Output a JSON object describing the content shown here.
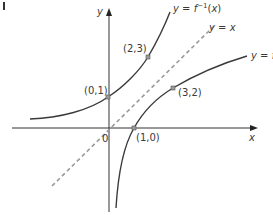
{
  "figure": {
    "corner_mark": "I",
    "axes": {
      "x_label": "x",
      "y_label": "y",
      "origin_label": "0"
    },
    "curves": [
      {
        "id": "f",
        "label": "y = f",
        "type": "logarithmic-like",
        "points_marked": [
          "(1,0)",
          "(3,2)"
        ]
      },
      {
        "id": "f_inverse",
        "label": "y = f⁻¹(x)",
        "label_parts": {
          "prefix": "y = f",
          "sup": "−1",
          "suffix": "(x)"
        },
        "type": "exponential-like",
        "points_marked": [
          "(0,1)",
          "(2,3)"
        ]
      },
      {
        "id": "identity",
        "label": "y = x",
        "style": "dashed"
      }
    ],
    "point_labels": {
      "p01": "(0,1)",
      "p23": "(2,3)",
      "p32": "(3,2)",
      "p10": "(1,0)"
    },
    "colors": {
      "curve": "#3a3a3a",
      "axis": "#333333",
      "dashed_line": "#9a9a9a",
      "point_fill": "#9a9a9a"
    }
  }
}
